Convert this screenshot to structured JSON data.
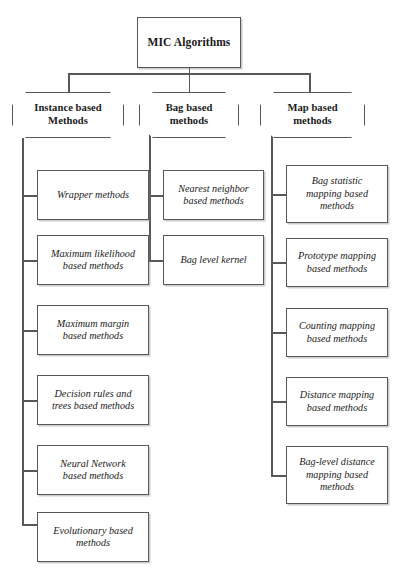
{
  "diagram": {
    "type": "tree",
    "root": {
      "label": "MIC Algorithms"
    },
    "branches": [
      {
        "id": "instance-based",
        "label": "Instance based\nMethods",
        "children": [
          {
            "label": "Wrapper methods"
          },
          {
            "label": "Maximum likelihood\nbased methods"
          },
          {
            "label": "Maximum margin\nbased methods"
          },
          {
            "label": "Decision rules and\ntrees based methods"
          },
          {
            "label": "Neural Network\nbased methods"
          },
          {
            "label": "Evolutionary based\nmethods"
          }
        ]
      },
      {
        "id": "bag-based",
        "label": "Bag based\nmethods",
        "children": [
          {
            "label": "Nearest neighbor\nbased methods"
          },
          {
            "label": "Bag level kernel"
          }
        ]
      },
      {
        "id": "map-based",
        "label": "Map based\nmethods",
        "children": [
          {
            "label": "Bag statistic\nmapping based\nmethods"
          },
          {
            "label": "Prototype mapping\nbased methods"
          },
          {
            "label": "Counting mapping\nbased methods"
          },
          {
            "label": "Distance mapping\nbased methods"
          },
          {
            "label": "Bag-level distance\nmapping based\nmethods"
          }
        ]
      }
    ],
    "colors": {
      "background": "#ffffff",
      "stroke": "#58585c",
      "text": "#1a1a1a"
    }
  }
}
